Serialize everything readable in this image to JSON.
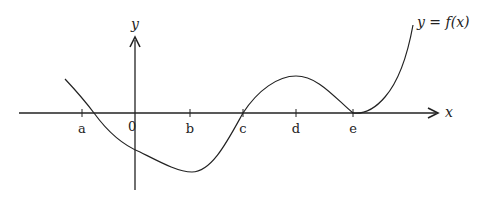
{
  "figure": {
    "x_axis_label": "x",
    "y_axis_label": "y",
    "curve_label": "y = f(x)",
    "origin_label": "0",
    "tick_labels": [
      "a",
      "b",
      "c",
      "d",
      "e"
    ],
    "colors": {
      "stroke": "#222222",
      "background": "#ffffff"
    }
  },
  "chart_data": {
    "type": "line",
    "title": "",
    "xlabel": "x",
    "ylabel": "y",
    "series": [
      {
        "name": "y = f(x)",
        "description": "curve decreasing from upper-left, crossing x-axis between a and 0, minimum at x=b, crossing zero at x=c, local maximum at x=d, touching the x-axis at x=e, then increasing steeply"
      }
    ],
    "key_points": [
      {
        "x": "b",
        "feature": "local minimum"
      },
      {
        "x": "c",
        "feature": "zero crossing"
      },
      {
        "x": "d",
        "feature": "local maximum"
      },
      {
        "x": "e",
        "feature": "double root / local minimum on x-axis"
      }
    ],
    "grid": false
  }
}
